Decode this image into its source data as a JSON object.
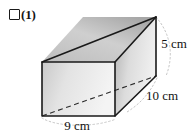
{
  "item": {
    "checkbox_icon": "empty-checkbox-icon",
    "number_label": "(1)"
  },
  "figure": {
    "name": "rectangular-prism-diagram",
    "shape": "rectangular prism",
    "dimensions": [
      {
        "id": "height",
        "label": "5 cm",
        "value": 5,
        "unit": "cm"
      },
      {
        "id": "depth",
        "label": "10 cm",
        "value": 10,
        "unit": "cm"
      },
      {
        "id": "width",
        "label": "9 cm",
        "value": 9,
        "unit": "cm"
      }
    ],
    "colors": {
      "outline": "#1a1a1a",
      "front_face_light": "#f2f2f2",
      "front_face_dark": "#c9c9c9",
      "top_face_light": "#d4d4d4",
      "top_face_dark": "#ababab",
      "side_face_light": "#efefef",
      "side_face_dark": "#b3b3b3",
      "guide_line": "#b5b5b5",
      "hidden_edge": "#2b2b2b",
      "background": "#ffffff"
    }
  }
}
